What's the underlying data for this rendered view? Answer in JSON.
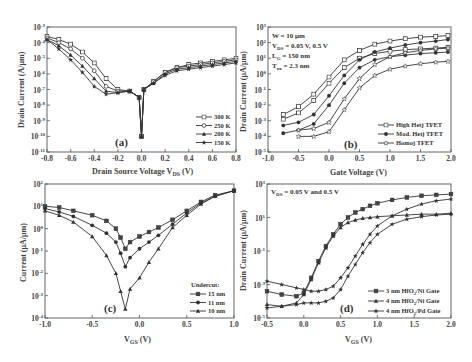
{
  "chart_data": [
    {
      "id": "a",
      "type": "line",
      "panel_label": "(a)",
      "xlabel": "Drain Source Voltage V_DS (V)",
      "ylabel": "Drain Current (A/μm)",
      "xlim": [
        -0.8,
        0.8
      ],
      "ylim_log10": [
        -11,
        -3
      ],
      "yscale": "log",
      "x_ticks": [
        "-0.8",
        "-0.6",
        "-0.4",
        "-0.2",
        "0.0",
        "0.2",
        "0.4",
        "0.6",
        "0.8"
      ],
      "y_ticks": [
        "10^-3",
        "10^-4",
        "10^-5",
        "10^-6",
        "10^-7",
        "10^-8",
        "10^-9",
        "10^-10",
        "10^-11"
      ],
      "legend_position": "lower right",
      "x": [
        -0.8,
        -0.7,
        -0.6,
        -0.5,
        -0.4,
        -0.3,
        -0.2,
        -0.1,
        -0.02,
        0.0,
        0.02,
        0.1,
        0.2,
        0.3,
        0.4,
        0.5,
        0.6,
        0.7,
        0.8
      ],
      "series": [
        {
          "name": "300 K",
          "marker": "open-square",
          "log10_values": [
            -3.6,
            -3.8,
            -4.1,
            -4.6,
            -5.3,
            -6.3,
            -7.0,
            -7.1,
            -7.5,
            -10,
            -7.0,
            -6.5,
            -5.9,
            -5.6,
            -5.4,
            -5.3,
            -5.2,
            -5.1,
            -5.0
          ]
        },
        {
          "name": "250 K",
          "marker": "open-circle",
          "log10_values": [
            -3.7,
            -4.0,
            -4.4,
            -5.0,
            -5.8,
            -6.8,
            -7.1,
            -7.1,
            -7.5,
            -10,
            -7.0,
            -6.5,
            -5.9,
            -5.6,
            -5.5,
            -5.4,
            -5.3,
            -5.2,
            -5.1
          ]
        },
        {
          "name": "200 K",
          "marker": "filled-triangle",
          "log10_values": [
            -3.8,
            -4.2,
            -4.8,
            -5.5,
            -6.3,
            -7.1,
            -7.2,
            -7.1,
            -7.5,
            -10,
            -7.0,
            -6.6,
            -6.0,
            -5.7,
            -5.6,
            -5.5,
            -5.4,
            -5.3,
            -5.2
          ]
        },
        {
          "name": "150 K",
          "marker": "filled-star",
          "log10_values": [
            -3.8,
            -4.4,
            -5.1,
            -5.9,
            -6.8,
            -7.3,
            -7.2,
            -7.1,
            -7.5,
            -10,
            -7.0,
            -6.6,
            -6.1,
            -5.8,
            -5.7,
            -5.6,
            -5.5,
            -5.4,
            -5.3
          ]
        }
      ]
    },
    {
      "id": "b",
      "type": "line",
      "panel_label": "(b)",
      "xlabel": "Gate Voltage (V)",
      "ylabel": "Drain Current (μA/μm)",
      "xlim": [
        -1.0,
        2.0
      ],
      "ylim_log10": [
        -5,
        3
      ],
      "yscale": "log",
      "x_ticks": [
        "-1.0",
        "-0.5",
        "0.0",
        "0.5",
        "1.0",
        "1.5",
        "2.0"
      ],
      "y_ticks": [
        "10^3",
        "10^2",
        "10^1",
        "10^0",
        "10^-1",
        "10^-2",
        "10^-3",
        "10^-4",
        "10^-5"
      ],
      "annotations": [
        "W = 10 μm",
        "V_DS = 0.05 V, 0.5 V",
        "L_G = 150 nm",
        "T_ox = 2.3 nm"
      ],
      "legend_position": "lower right",
      "x": [
        -0.75,
        -0.5,
        -0.25,
        0.0,
        0.25,
        0.5,
        0.75,
        1.0,
        1.25,
        1.5,
        1.75,
        1.95
      ],
      "series": [
        {
          "name": "High Hetj TFET (V_DS=0.5 V)",
          "marker": "open-square",
          "log10_values": [
            -2.6,
            -2.1,
            -1.3,
            -0.2,
            0.9,
            1.5,
            1.9,
            2.1,
            2.25,
            2.35,
            2.4,
            2.45
          ]
        },
        {
          "name": "High Hetj TFET (V_DS=0.05 V)",
          "marker": "open-square",
          "log10_values": [
            -2.9,
            -2.5,
            -1.7,
            -0.6,
            0.4,
            1.0,
            1.3,
            1.45,
            1.55,
            1.6,
            1.65,
            1.7
          ]
        },
        {
          "name": "Mod. Hetj TFET (V_DS=0.5 V)",
          "marker": "filled-circle",
          "log10_values": [
            -3.3,
            -3.1,
            -2.6,
            -1.4,
            -0.1,
            0.9,
            1.4,
            1.65,
            1.85,
            2.0,
            2.1,
            2.2
          ]
        },
        {
          "name": "Mod. Hetj TFET (V_DS=0.05 V)",
          "marker": "filled-circle",
          "log10_values": [
            -3.8,
            -3.6,
            -3.2,
            -2.0,
            -0.6,
            0.4,
            0.9,
            1.1,
            1.2,
            1.3,
            1.35,
            1.4
          ]
        },
        {
          "name": "Homoj TFET (V_DS=0.5 V)",
          "marker": "open-star",
          "log10_values": [
            null,
            -3.6,
            -3.5,
            -3.1,
            -1.6,
            -0.3,
            0.6,
            1.1,
            1.35,
            1.5,
            1.6,
            1.65
          ]
        },
        {
          "name": "Homoj TFET (V_DS=0.05 V)",
          "marker": "open-star",
          "log10_values": [
            null,
            -4.0,
            -4.0,
            -3.7,
            -2.3,
            -0.9,
            -0.1,
            0.3,
            0.5,
            0.65,
            0.75,
            0.8
          ]
        }
      ]
    },
    {
      "id": "c",
      "type": "line",
      "panel_label": "(c)",
      "xlabel": "V_GS (V)",
      "ylabel": "Current (μA/μm)",
      "xlim": [
        -1.0,
        1.0
      ],
      "ylim_log10": [
        -4,
        2
      ],
      "yscale": "log",
      "x_ticks": [
        "-1.0",
        "-0.5",
        "0.0",
        "0.5",
        "1.0"
      ],
      "y_ticks": [
        "10^2",
        "10^1",
        "10^0",
        "10^-1",
        "10^-2",
        "10^-3",
        "10^-4"
      ],
      "legend_title": "Undercut:",
      "legend_position": "lower right",
      "x": [
        -1.0,
        -0.85,
        -0.7,
        -0.5,
        -0.35,
        -0.25,
        -0.2,
        -0.15,
        -0.1,
        0.0,
        0.1,
        0.2,
        0.35,
        0.5,
        0.65,
        0.8,
        1.0
      ],
      "series": [
        {
          "name": "15 nm",
          "marker": "filled-square",
          "log10_values": [
            1.0,
            0.95,
            0.8,
            0.6,
            0.35,
            0.0,
            -0.4,
            -0.9,
            -0.6,
            -0.35,
            -0.15,
            0.05,
            0.4,
            0.8,
            1.2,
            1.5,
            1.7
          ]
        },
        {
          "name": "11 nm",
          "marker": "filled-circle",
          "log10_values": [
            0.9,
            0.75,
            0.55,
            0.15,
            -0.2,
            -0.6,
            -1.1,
            -1.7,
            -1.3,
            -0.9,
            -0.6,
            -0.3,
            0.2,
            0.7,
            1.15,
            1.45,
            1.7
          ]
        },
        {
          "name": "10 nm",
          "marker": "filled-triangle",
          "log10_values": [
            0.8,
            0.6,
            0.3,
            -0.35,
            -1.2,
            -2.0,
            -2.8,
            -3.6,
            -2.7,
            -2.2,
            -1.5,
            -0.9,
            0.05,
            0.6,
            1.1,
            1.45,
            1.7
          ]
        }
      ]
    },
    {
      "id": "d",
      "type": "line",
      "panel_label": "(d)",
      "xlabel": "V_GS (V)",
      "ylabel": "Drain Current (μA/μm)",
      "xlim": [
        -0.5,
        2.0
      ],
      "ylim_log10": [
        -5,
        3
      ],
      "yscale": "log",
      "x_ticks": [
        "-0.5",
        "0.0",
        "0.5",
        "1.0",
        "1.5",
        "2.0"
      ],
      "y_ticks": [
        "10^3",
        "10^1",
        "10^-1",
        "10^-3",
        "10^-5"
      ],
      "annotations": [
        "V_DS = 0.05 V and 0.5 V"
      ],
      "legend_position": "lower right",
      "x": [
        -0.5,
        -0.3,
        -0.1,
        0.0,
        0.1,
        0.2,
        0.3,
        0.4,
        0.5,
        0.6,
        0.7,
        0.8,
        0.9,
        1.0,
        1.2,
        1.4,
        1.6,
        1.8,
        2.0
      ],
      "series": [
        {
          "name": "3 nm HfO2/Ni Gate",
          "marker": "filled-square",
          "log10_values": [
            -3.4,
            -3.6,
            -3.7,
            -3.5,
            -2.6,
            -1.6,
            -0.7,
            0.0,
            0.6,
            1.0,
            1.3,
            1.5,
            1.7,
            1.85,
            2.05,
            2.2,
            2.3,
            2.35,
            2.4
          ]
        },
        {
          "name": "4 nm HfO2/Ni Gate",
          "marker": "filled-triangle",
          "log10_values": [
            -4.2,
            -4.3,
            -4.1,
            -3.6,
            -2.7,
            -1.7,
            -0.8,
            -0.1,
            0.4,
            0.7,
            0.85,
            0.95,
            1.0,
            1.05,
            1.1,
            1.15,
            1.2,
            1.2,
            1.25
          ]
        },
        {
          "name": "4 nm HfO2/Pd Gate",
          "marker": "filled-star",
          "log10_values": [
            -2.8,
            -3.0,
            -3.2,
            -3.3,
            -3.4,
            -3.4,
            -3.3,
            -3.1,
            -2.6,
            -2.0,
            -1.3,
            -0.6,
            0.0,
            0.5,
            1.1,
            1.5,
            1.8,
            2.0,
            2.1
          ]
        },
        {
          "name": "4 nm HfO2/Pd Gate (V_DS=0.05 V)",
          "marker": "filled-star",
          "log10_values": [
            -4.4,
            -4.3,
            -4.2,
            -4.1,
            -4.1,
            -4.1,
            -4.0,
            -3.8,
            -3.3,
            -2.5,
            -1.8,
            -1.1,
            -0.5,
            0.0,
            0.6,
            0.9,
            1.05,
            1.15,
            1.2
          ]
        }
      ]
    }
  ],
  "panels": {
    "a": {
      "label": "(a)",
      "xlabel": "Drain Source Voltage V",
      "xlabel_sub": "DS",
      "xlabel_tail": " (V)",
      "ylabel": "Drain Current (A/μm)",
      "legend": [
        "300 K",
        "250 K",
        "200 K",
        "150 K"
      ]
    },
    "b": {
      "label": "(b)",
      "xlabel": "Gate Voltage (V)",
      "ylabel": "Drain Current (μA/μm)",
      "ann": [
        "W = 10 μm",
        "V",
        "DS",
        " = 0.05 V, 0.5 V",
        "L",
        "G",
        " = 150 nm",
        "T",
        "ox",
        " = 2.3 nm"
      ],
      "legend": [
        "High Hetj TFET",
        "Mod. Hetj TFET",
        "Homoj TFET"
      ]
    },
    "c": {
      "label": "(c)",
      "xlabel": "V",
      "xlabel_sub": "GS",
      "xlabel_tail": " (V)",
      "ylabel": "Current (μA/μm)",
      "legend_title": "Undercut:",
      "legend": [
        "15 nm",
        "11 nm",
        "10 nm"
      ]
    },
    "d": {
      "label": "(d)",
      "xlabel": "V",
      "xlabel_sub": "GS",
      "xlabel_tail": " (V)",
      "ylabel": "Drain Current (μA/μm)",
      "ann": [
        "V",
        "DS",
        " = 0.05 V and 0.5 V"
      ],
      "legend": [
        "3 nm HfO",
        "2",
        "/Ni Gate",
        "4 nm HfO",
        "2",
        "/Ni Gate",
        "4 nm HfO",
        "2",
        "/Pd Gate"
      ]
    }
  }
}
